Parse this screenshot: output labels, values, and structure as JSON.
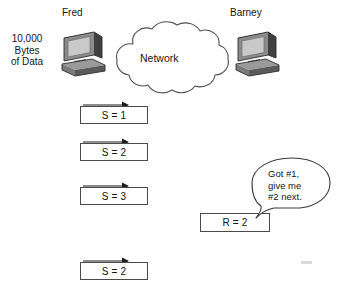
{
  "diagram": {
    "hosts": [
      {
        "id": "fred",
        "label": "Fred",
        "icon": "desktop-computer-icon"
      },
      {
        "id": "barney",
        "label": "Barney",
        "icon": "desktop-computer-icon"
      }
    ],
    "data_note": "10,000\nBytes\nof Data",
    "data_note_lines": [
      "10,000",
      "Bytes",
      "of Data"
    ],
    "network": {
      "label": "Network",
      "shape": "cloud-icon"
    },
    "segments": [
      {
        "id": "seg-1",
        "label": "S = 1",
        "arrow": "right-arrow-icon",
        "direction": "left-to-right"
      },
      {
        "id": "seg-2",
        "label": "S = 2",
        "arrow": "right-arrow-icon",
        "direction": "left-to-right"
      },
      {
        "id": "seg-3",
        "label": "S = 3",
        "arrow": "right-arrow-icon",
        "direction": "left-to-right"
      },
      {
        "id": "seg-4",
        "label": "S = 2",
        "arrow": "right-arrow-icon",
        "direction": "left-to-right"
      }
    ],
    "acknowledgment": {
      "label": "R = 2"
    },
    "speech_bubble": {
      "text": "Got #1, give me #2 next.",
      "lines": [
        "Got #1,",
        "give me",
        "#2 next."
      ],
      "speaker": "barney"
    },
    "colors": {
      "background": "#ffffff",
      "ink": "#161616",
      "box_border": "#4a4a4a",
      "monitor_body": "#8a8a8a",
      "monitor_dark": "#3d3d3d",
      "monitor_screen": "#c9c9c9",
      "base_gray": "#737373",
      "cloud_stroke": "#4f4f4f"
    }
  }
}
